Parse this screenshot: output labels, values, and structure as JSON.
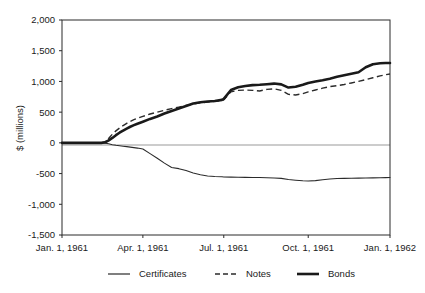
{
  "chart_data": {
    "type": "line",
    "title": "",
    "subtitle": "",
    "xlabel": "",
    "ylabel": "$ (millions)",
    "ylim": [
      -1500,
      2000
    ],
    "yticks": [
      2000,
      1500,
      1000,
      500,
      0,
      -500,
      -1000,
      -1500
    ],
    "ytick_labels": [
      "2,000",
      "1,500",
      "1,000",
      "500",
      "0",
      "-500",
      "-1,000",
      "-1,500"
    ],
    "xlim": [
      "Jan. 1, 1961",
      "Jan. 1, 1962"
    ],
    "xticks": [
      "Jan. 1, 1961",
      "Apr. 1, 1961",
      "Jul. 1, 1961",
      "Oct. 1, 1961",
      "Jan. 1, 1962"
    ],
    "xtick_positions": [
      0,
      0.2466,
      0.4932,
      0.7507,
      1.0
    ],
    "grid": false,
    "legend_position": "bottom",
    "zero_reference_line": true,
    "x": [
      0.0,
      0.03,
      0.06,
      0.09,
      0.12,
      0.1315,
      0.1425,
      0.1534,
      0.1644,
      0.1753,
      0.1863,
      0.1973,
      0.2082,
      0.2192,
      0.2301,
      0.2466,
      0.2685,
      0.2904,
      0.3123,
      0.3342,
      0.3562,
      0.3781,
      0.4,
      0.4219,
      0.4438,
      0.4658,
      0.4877,
      0.4932,
      0.5151,
      0.537,
      0.5589,
      0.5808,
      0.6027,
      0.6247,
      0.6466,
      0.6685,
      0.6904,
      0.7123,
      0.7342,
      0.7507,
      0.7726,
      0.7945,
      0.8164,
      0.8384,
      0.8603,
      0.8822,
      0.9041,
      0.926,
      0.9479,
      0.9699,
      0.9863,
      1.0
    ],
    "series": [
      {
        "name": "Certificates",
        "style": "thin-solid",
        "values": [
          0,
          0,
          0,
          0,
          0,
          -5,
          -15,
          -30,
          -40,
          -48,
          -55,
          -62,
          -70,
          -78,
          -85,
          -100,
          -175,
          -250,
          -330,
          -400,
          -420,
          -450,
          -490,
          -520,
          -540,
          -548,
          -552,
          -555,
          -558,
          -560,
          -562,
          -563,
          -565,
          -568,
          -572,
          -578,
          -596,
          -608,
          -618,
          -622,
          -615,
          -600,
          -588,
          -580,
          -578,
          -576,
          -574,
          -572,
          -570,
          -568,
          -566,
          -565
        ]
      },
      {
        "name": "Notes",
        "style": "dashed",
        "values": [
          0,
          0,
          0,
          0,
          0,
          20,
          75,
          140,
          195,
          240,
          282,
          318,
          350,
          378,
          400,
          430,
          470,
          500,
          530,
          558,
          582,
          608,
          632,
          650,
          665,
          675,
          690,
          700,
          830,
          855,
          860,
          855,
          845,
          870,
          880,
          855,
          790,
          780,
          800,
          830,
          860,
          890,
          915,
          930,
          950,
          975,
          1000,
          1030,
          1060,
          1090,
          1110,
          1120
        ]
      },
      {
        "name": "Bonds",
        "style": "thick-solid",
        "values": [
          0,
          0,
          0,
          0,
          0,
          10,
          40,
          80,
          125,
          165,
          200,
          232,
          262,
          288,
          312,
          345,
          390,
          430,
          478,
          520,
          560,
          600,
          640,
          660,
          672,
          682,
          700,
          715,
          860,
          905,
          925,
          940,
          945,
          955,
          965,
          952,
          900,
          912,
          945,
          975,
          1000,
          1020,
          1045,
          1075,
          1100,
          1125,
          1150,
          1230,
          1280,
          1295,
          1300,
          1300
        ]
      }
    ]
  },
  "legend": {
    "items": [
      {
        "label": "Certificates",
        "style": "thin-solid"
      },
      {
        "label": "Notes",
        "style": "dashed"
      },
      {
        "label": "Bonds",
        "style": "thick-solid"
      }
    ]
  }
}
